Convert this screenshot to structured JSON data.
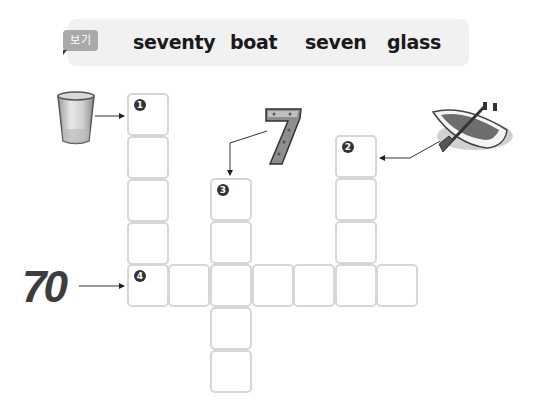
{
  "word_bank": {
    "badge_label": "보기",
    "words": [
      "seventy",
      "boat",
      "seven",
      "glass"
    ]
  },
  "clues": [
    {
      "number": "1",
      "picture": "glass-icon",
      "direction": "down",
      "length": 5
    },
    {
      "number": "2",
      "picture": "boat-icon",
      "direction": "down",
      "length": 4
    },
    {
      "number": "3",
      "picture": "number-7-icon",
      "direction": "down",
      "length": 5
    },
    {
      "number": "4",
      "picture": "number-70-icon",
      "direction": "across",
      "length": 7
    }
  ],
  "labels": {
    "seventy_numeral": "70"
  },
  "colors": {
    "cell_border": "#d6d6d6",
    "badge_bg": "#a9a9a9",
    "wordbank_bg": "#f1f1f1",
    "number_circle": "#333333"
  }
}
